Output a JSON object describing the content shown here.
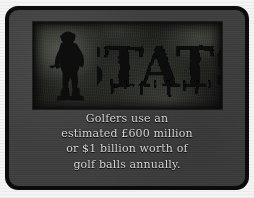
{
  "card": {
    "background_color": "#3e3e3e",
    "border_color": "#0b0b0b",
    "page_color": "#f4f4f4"
  },
  "banner": {
    "title": "STATS",
    "title_color": "#0a0a0a",
    "texture_color": "#3c3f38",
    "golfer_icon": "golfer-silhouette-icon"
  },
  "caption": {
    "text_color": "#d9d9d9",
    "lines": [
      "Golfers use an",
      "estimated £600 million",
      "or $1 billion worth of",
      "golf balls annually."
    ],
    "full_text": "Golfers use an estimated £600 million or $1 billion worth of golf balls annually."
  }
}
